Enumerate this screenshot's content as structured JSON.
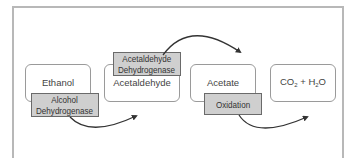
{
  "diagram": {
    "nodes": [
      {
        "id": "ethanol",
        "label": "Ethanol"
      },
      {
        "id": "acetaldehyde",
        "label": "Acetaldehyde"
      },
      {
        "id": "acetate",
        "label": "Acetate"
      },
      {
        "id": "co2_h2o",
        "label_parts": {
          "co": "CO",
          "two": "2",
          "plus": " + H",
          "h_sub": "2",
          "o": "O"
        }
      }
    ],
    "enzymes": [
      {
        "id": "alcohol-dehydrogenase",
        "line1": "Alcohol",
        "line2": "Dehydrogenase"
      },
      {
        "id": "acetaldehyde-dehydrogenase",
        "line1": "Acetaldehyde",
        "line2": "Dehydrogenase"
      },
      {
        "id": "oxidation",
        "line1": "Oxidation"
      }
    ],
    "edges": [
      {
        "from": "ethanol",
        "to": "acetaldehyde",
        "via": "alcohol-dehydrogenase"
      },
      {
        "from": "acetaldehyde",
        "to": "acetate",
        "via": "acetaldehyde-dehydrogenase"
      },
      {
        "from": "acetate",
        "to": "co2_h2o",
        "via": "oxidation"
      }
    ],
    "colors": {
      "enzyme_fill": "#cfcfcf",
      "node_border": "#9a9a9a",
      "frame": "#b8b8b8",
      "arrow": "#333333"
    }
  }
}
